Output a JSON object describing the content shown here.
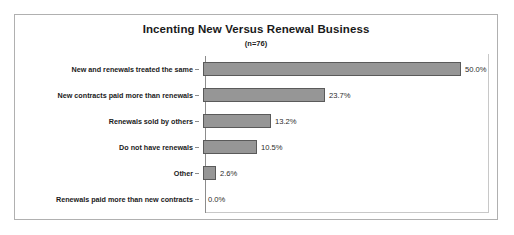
{
  "chart_data": {
    "type": "bar",
    "orientation": "horizontal",
    "title": "Incenting New Versus Renewal Business",
    "subtitle": "(n=76)",
    "xlabel": "",
    "ylabel": "",
    "xlim": [
      0,
      50
    ],
    "grid": false,
    "legend": "none",
    "value_suffix": "%",
    "categories": [
      "New and renewals treated the same",
      "New contracts paid more than renewals",
      "Renewals sold by others",
      "Do not have renewals",
      "Other",
      "Renewals paid more than new contracts"
    ],
    "values": [
      50.0,
      23.7,
      13.2,
      10.5,
      2.6,
      0.0
    ],
    "value_labels": [
      "50.0%",
      "23.7%",
      "13.2%",
      "10.5%",
      "2.6%",
      "0.0%"
    ],
    "bars": [
      {
        "label": "New and renewals treated the same",
        "value": 50.0,
        "value_label": "50.0%"
      },
      {
        "label": "New contracts paid more than renewals",
        "value": 23.7,
        "value_label": "23.7%"
      },
      {
        "label": "Renewals sold by others",
        "value": 13.2,
        "value_label": "13.2%"
      },
      {
        "label": "Do not have renewals",
        "value": 10.5,
        "value_label": "10.5%"
      },
      {
        "label": "Other",
        "value": 2.6,
        "value_label": "2.6%"
      },
      {
        "label": "Renewals paid more than new contracts",
        "value": 0.0,
        "value_label": "0.0%"
      }
    ],
    "colors": {
      "bar_fill": "#969696",
      "bar_border": "#5a5a5a",
      "axis": "#8c8c8c",
      "plot_border": "#c8c8c8",
      "card_border": "#b0b0b0",
      "background": "#ffffff",
      "text": "#1a1a1a",
      "value_text": "#2b2b2b"
    }
  }
}
